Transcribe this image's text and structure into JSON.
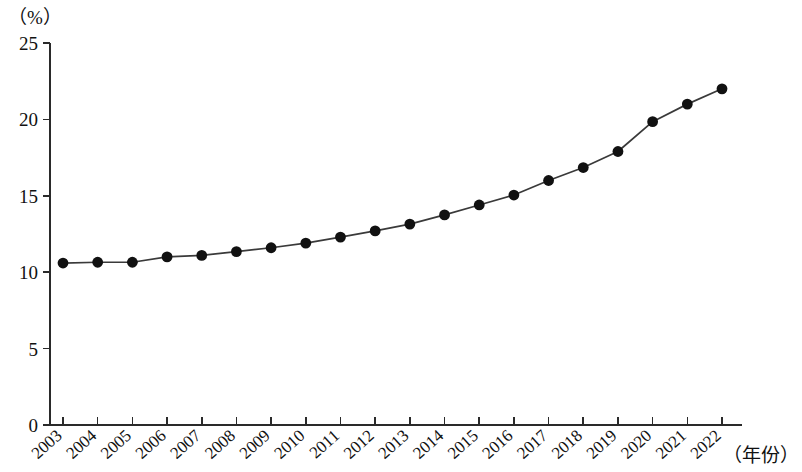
{
  "chart_data": {
    "type": "line",
    "title": "",
    "subtitle": "",
    "xlabel": "（年份）",
    "ylabel": "（%）",
    "ylim": [
      0,
      25
    ],
    "y_ticks": [
      0,
      5,
      10,
      15,
      20,
      25
    ],
    "grid": false,
    "legend": null,
    "marker": "filled-circle",
    "categories": [
      "2003",
      "2004",
      "2005",
      "2006",
      "2007",
      "2008",
      "2009",
      "2010",
      "2011",
      "2012",
      "2013",
      "2014",
      "2015",
      "2016",
      "2017",
      "2018",
      "2019",
      "2020",
      "2021",
      "2022"
    ],
    "values": [
      10.6,
      10.65,
      10.65,
      11.0,
      11.1,
      11.35,
      11.6,
      11.9,
      12.3,
      12.7,
      13.15,
      13.75,
      14.4,
      15.05,
      16.0,
      16.85,
      17.9,
      19.85,
      21.0,
      22.0
    ],
    "series": [
      {
        "name": "",
        "values": [
          10.6,
          10.65,
          10.65,
          11.0,
          11.1,
          11.35,
          11.6,
          11.9,
          12.3,
          12.7,
          13.15,
          13.75,
          14.4,
          15.05,
          16.0,
          16.85,
          17.9,
          19.85,
          21.0,
          22.0
        ]
      }
    ],
    "annotations": []
  },
  "axis": {
    "y_unit": "（%）",
    "x_unit": "（年份）"
  },
  "colors": {
    "line": "#3a3a3a",
    "marker": "#111111",
    "axis": "#2a2a2a",
    "background": "#ffffff"
  }
}
